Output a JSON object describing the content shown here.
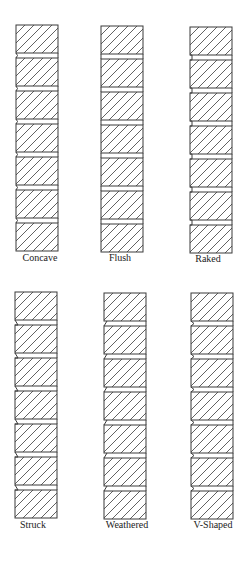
{
  "colors": {
    "stroke": "#3a3a3a",
    "background": "#ffffff"
  },
  "panels": [
    {
      "label": "Concave",
      "joint": "concave",
      "x": 15,
      "y": 25,
      "label_x": 40,
      "label_y": 252
    },
    {
      "label": "Flush",
      "joint": "flush",
      "x": 100,
      "y": 26,
      "label_x": 120,
      "label_y": 252
    },
    {
      "label": "Raked",
      "joint": "raked",
      "x": 189,
      "y": 27,
      "label_x": 208,
      "label_y": 253
    },
    {
      "label": "Struck",
      "joint": "struck",
      "x": 14,
      "y": 292,
      "label_x": 33,
      "label_y": 519
    },
    {
      "label": "Weathered",
      "joint": "weathered",
      "x": 103,
      "y": 293,
      "label_x": 127,
      "label_y": 519
    },
    {
      "label": "V-Shaped",
      "joint": "v-shaped",
      "x": 190,
      "y": 293,
      "label_x": 212,
      "label_y": 519
    }
  ],
  "brick": {
    "count": 7,
    "width": 42,
    "height": 28,
    "joint_height": 5
  }
}
